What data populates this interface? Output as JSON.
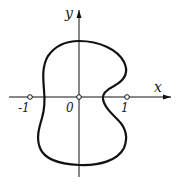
{
  "diagram": {
    "axes": {
      "x_label": "x",
      "y_label": "y",
      "origin_label": "0"
    },
    "tick_labels": {
      "neg_one": "-1",
      "pos_one": "1"
    },
    "curve": {
      "description": "closed peanut-shaped curve around origin, indented on right side at x-axis",
      "color": "#111111"
    },
    "colors": {
      "ink": "#111111",
      "background": "#ffffff"
    }
  }
}
